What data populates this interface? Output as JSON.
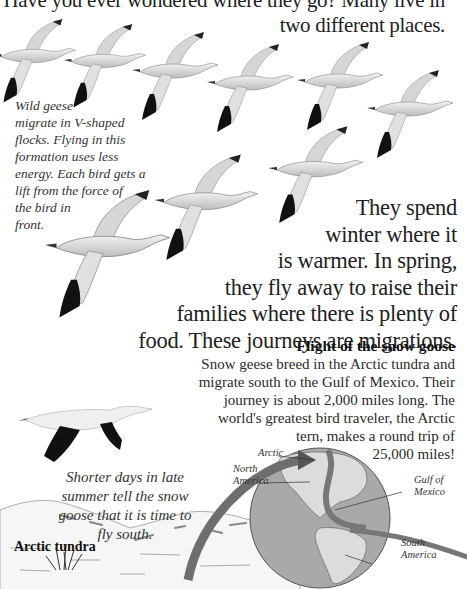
{
  "intro": {
    "lines": [
      "Have you ever wondered where they go? Many live in",
      "two different places."
    ]
  },
  "v_caption": {
    "lines": [
      "Wild geese",
      "migrate in V-shaped",
      "flocks. Flying in this",
      "formation uses less",
      "energy. Each bird gets a",
      "lift from the force of",
      "the bird in",
      "front."
    ]
  },
  "main_text": {
    "lines": [
      "They spend",
      "winter where it",
      "is warmer. In spring,",
      "they fly away to raise their",
      "families where there is plenty of",
      "food. These journeys are migrations."
    ]
  },
  "flight_section": {
    "title": "Flight of the snow goose",
    "lines": [
      "Snow geese breed in the Arctic tundra and",
      "migrate south to the Gulf of Mexico. Their",
      "journey is about 2,000 miles long. The",
      "world's greatest bird traveler, the Arctic",
      "tern, makes a round trip of",
      "25,000 miles!"
    ]
  },
  "south_caption": {
    "lines": [
      "Shorter days in late",
      "summer tell the snow",
      "goose that it is time to",
      "fly south."
    ]
  },
  "tundra_label": "Arctic tundra",
  "map_labels": {
    "arctic": "Arctic",
    "north_america": [
      "North",
      "America"
    ],
    "gulf_of_mexico": [
      "Gulf of",
      "Mexico"
    ],
    "south_america": [
      "South",
      "America"
    ]
  },
  "colors": {
    "globe": "#a9a9a9",
    "land": "#dcdcdc",
    "arrow": "#6e6e6e",
    "wingtip": "#111111"
  }
}
